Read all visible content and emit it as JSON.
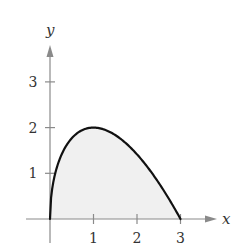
{
  "chart_data": {
    "type": "area",
    "title": "",
    "function": "y = sqrt(x) * (3 - x)",
    "xlabel": "x",
    "ylabel": "y",
    "xlim": [
      0,
      3
    ],
    "ylim": [
      0,
      3
    ],
    "x_ticks": [
      1,
      2,
      3
    ],
    "y_ticks": [
      1,
      2,
      3
    ],
    "x_tick_labels": [
      "1",
      "2",
      "3"
    ],
    "y_tick_labels": [
      "1",
      "2",
      "3"
    ],
    "grid": false,
    "legend": null,
    "shaded_region": "area under curve from x = 0 to x = 3",
    "series": [
      {
        "name": "curve",
        "x": [
          0,
          0.05,
          0.1,
          0.25,
          0.5,
          0.75,
          1,
          1.25,
          1.5,
          1.75,
          2,
          2.25,
          2.5,
          2.75,
          3
        ],
        "y": [
          0,
          0.66,
          0.92,
          1.38,
          1.77,
          1.95,
          2.0,
          1.96,
          1.84,
          1.65,
          1.41,
          1.13,
          0.79,
          0.41,
          0
        ]
      }
    ],
    "colors": {
      "curve": "#111111",
      "fill": "#f0f0f0",
      "axes": "#8a8a8a",
      "text": "#333333"
    }
  },
  "axes": {
    "x_label": "x",
    "y_label": "y"
  }
}
